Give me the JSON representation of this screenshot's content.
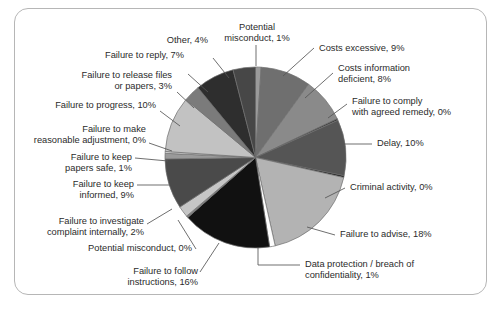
{
  "chart_data": {
    "type": "pie",
    "title": "",
    "subtitle": "",
    "xlabel": "",
    "ylabel": "",
    "legend_position": "none",
    "grid": false,
    "labels_show_percent": true,
    "start_angle_deg": 0,
    "direction": "clockwise",
    "categories": [
      "Potential misconduct",
      "Costs excessive",
      "Costs information deficient",
      "Failure to comply with agreed remedy",
      "Delay",
      "Criminal activity",
      "Failure to advise",
      "Data protection / breach of confidentiality",
      "Failure to follow instructions",
      "Potential misconduct",
      "Failure to investigate complaint internally",
      "Failure to keep informed",
      "Failure to keep papers safe",
      "Failure to make reasonable adjustment",
      "Failure to progress",
      "Failure to release files or papers",
      "Failure to reply",
      "Other"
    ],
    "values": [
      1,
      9,
      8,
      0,
      10,
      0,
      18,
      1,
      16,
      0,
      2,
      9,
      1,
      0,
      10,
      3,
      7,
      4
    ],
    "units": "percent",
    "colors": [
      "#9a9a9a",
      "#6f6f6f",
      "#8a8a8a",
      "#3c3c3c",
      "#555555",
      "#1f1f1f",
      "#b3b3b3",
      "#fdfdfd",
      "#111111",
      "#7d7d7d",
      "#c6c6c6",
      "#4a4a4a",
      "#9a9a9a",
      "#dcdcdc",
      "#c2c2c2",
      "#7b7b7b",
      "#2e2e2e",
      "#474747"
    ],
    "slice_labels": [
      "Potential misconduct, 1%",
      "Costs excessive, 9%",
      "Costs information deficient, 8%",
      "Failure to comply with agreed remedy, 0%",
      "Delay, 10%",
      "Criminal activity, 0%",
      "Failure to advise, 18%",
      "Data protection / breach of confidentiality, 1%",
      "Failure to follow instructions, 16%",
      "Potential misconduct, 0%",
      "Failure to investigate complaint internally, 2%",
      "Failure to keep informed, 9%",
      "Failure to keep papers safe, 1%",
      "Failure to make reasonable adjustment, 0%",
      "Failure to progress, 10%",
      "Failure to release files or papers, 3%",
      "Failure to reply, 7%",
      "Other, 4%"
    ]
  },
  "labels": {
    "potential_misconduct_top_l1": "Potential",
    "potential_misconduct_top_l2": "misconduct, 1%",
    "costs_excessive": "Costs excessive, 9%",
    "costs_info_deficient_l1": "Costs information",
    "costs_info_deficient_l2": "deficient, 8%",
    "failure_comply_l1": "Failure to comply",
    "failure_comply_l2": "with agreed remedy, 0%",
    "delay": "Delay, 10%",
    "criminal_activity": "Criminal activity, 0%",
    "failure_advise": "Failure to advise, 18%",
    "data_protection_l1": "Data protection / breach of",
    "data_protection_l2": "confidentiality, 1%",
    "failure_follow_l1": "Failure to follow",
    "failure_follow_l2": "instructions, 16%",
    "potential_misconduct_zero": "Potential misconduct, 0%",
    "failure_investigate_l1": "Failure to investigate",
    "failure_investigate_l2": "complaint internally, 2%",
    "failure_keep_informed_l1": "Failure to keep",
    "failure_keep_informed_l2": "informed, 9%",
    "failure_keep_papers_l1": "Failure to keep",
    "failure_keep_papers_l2": "papers safe, 1%",
    "failure_reasonable_adj_l1": "Failure to make",
    "failure_reasonable_adj_l2": "reasonable adjustment, 0%",
    "failure_progress": "Failure to progress, 10%",
    "failure_release_l1": "Failure to release files",
    "failure_release_l2": "or papers, 3%",
    "failure_reply": "Failure to reply, 7%",
    "other": "Other, 4%"
  }
}
